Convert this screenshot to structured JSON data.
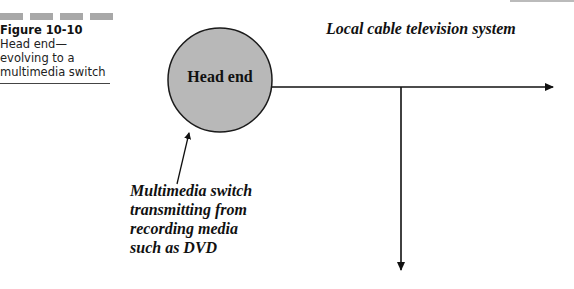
{
  "figure": {
    "number_label": "Figure 10-10",
    "caption": "Head end—evolving to a multimedia switch"
  },
  "diagram": {
    "system_label": "Local cable television system",
    "node": {
      "label": "Head end",
      "fill_color": "#b8b8b8",
      "stroke_color": "#1a1a1a"
    },
    "source_annotation": {
      "lines": [
        "Multimedia switch",
        "transmitting from",
        "recording media",
        "such as DVD"
      ]
    },
    "connections": [
      {
        "from": "Head end",
        "to": "right (distribution trunk)",
        "direction": "right"
      },
      {
        "from": "trunk branch",
        "to": "down (subscriber feed)",
        "direction": "down"
      },
      {
        "from": "Multimedia switch annotation",
        "to": "Head end",
        "direction": "up"
      }
    ]
  }
}
